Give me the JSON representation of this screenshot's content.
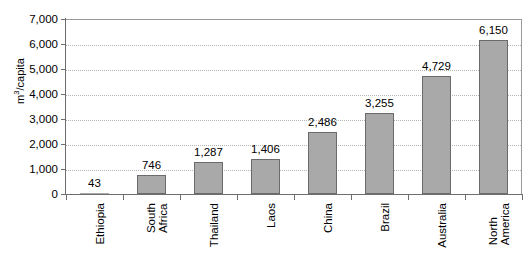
{
  "chart_data": {
    "type": "bar",
    "title": "",
    "xlabel": "",
    "ylabel": "m3/capita",
    "ylabel_display": "m",
    "ylabel_sup": "3",
    "ylabel_rest": "/capita",
    "categories": [
      "Ethiopia",
      "South Africa",
      "Thailand",
      "Laos",
      "China",
      "Brazil",
      "Australia",
      "North America"
    ],
    "category_lines": [
      [
        "Ethiopia"
      ],
      [
        "South",
        "Africa"
      ],
      [
        "Thailand"
      ],
      [
        "Laos"
      ],
      [
        "China"
      ],
      [
        "Brazil"
      ],
      [
        "Australia"
      ],
      [
        "North",
        "America"
      ]
    ],
    "values": [
      43,
      746,
      1287,
      1406,
      2486,
      3255,
      4729,
      6150
    ],
    "value_labels": [
      "43",
      "746",
      "1,287",
      "1,406",
      "2,486",
      "3,255",
      "4,729",
      "6,150"
    ],
    "ylim": [
      0,
      7000
    ],
    "ytick_values": [
      0,
      1000,
      2000,
      3000,
      4000,
      5000,
      6000,
      7000
    ],
    "ytick_labels": [
      "0",
      "1,000",
      "2,000",
      "3,000",
      "4,000",
      "5,000",
      "6,000",
      "7,000"
    ],
    "grid": true,
    "legend": "none",
    "bar_color": "#a9a9a9",
    "bar_border_color": "#6b6b6b",
    "axis_color": "#6e6e6e",
    "gridline_color": "#b4b4b4"
  }
}
